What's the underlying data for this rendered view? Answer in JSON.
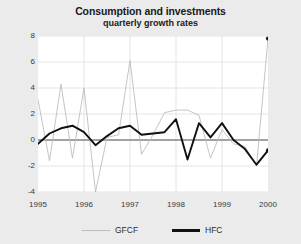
{
  "header": {
    "title": "Consumption and investments",
    "subtitle": "quarterly growth rates"
  },
  "annotations": {
    "unit": "(%)"
  },
  "legend": {
    "items": [
      {
        "label": "GFCF",
        "color": "#bdbdbd",
        "style": "thin-line"
      },
      {
        "label": "HFC",
        "color": "#111111",
        "style": "thick-line"
      }
    ]
  },
  "colors": {
    "background": "#ebebeb",
    "plot_background": "#ffffff",
    "gfcf": "#bdbdbd",
    "hfc": "#111111",
    "zero_line": "#555555",
    "gridline": "#e4e4e4",
    "text": "#2b2b2b"
  },
  "chart_data": {
    "type": "line",
    "title": "Consumption and investments",
    "subtitle": "quarterly growth rates",
    "xlabel": "",
    "ylabel": "(%)",
    "ylim": [
      -4,
      8
    ],
    "yticks": [
      -4,
      -2,
      0,
      2,
      4,
      6,
      8
    ],
    "ytick_labels": [
      "-4",
      "-2",
      "0",
      "2",
      "4",
      "6",
      "8"
    ],
    "xlim": [
      1995.0,
      2000.0
    ],
    "xticks": [
      1995,
      1996,
      1997,
      1998,
      1999,
      2000
    ],
    "xtick_labels": [
      "1995",
      "1996",
      "1997",
      "1998",
      "1999",
      "2000"
    ],
    "grid": true,
    "zero_line": true,
    "legend_position": "below",
    "x": [
      1995.0,
      1995.25,
      1995.5,
      1995.75,
      1996.0,
      1996.25,
      1996.5,
      1996.75,
      1997.0,
      1997.25,
      1997.5,
      1997.75,
      1998.0,
      1998.25,
      1998.5,
      1998.75,
      1999.0,
      1999.25,
      1999.5,
      1999.75,
      2000.0
    ],
    "series": [
      {
        "name": "GFCF",
        "color": "#bdbdbd",
        "end_marker": true,
        "values": [
          3.1,
          -1.6,
          4.3,
          -1.4,
          4.0,
          -4.0,
          0.2,
          0.4,
          6.1,
          -1.1,
          0.4,
          2.1,
          2.3,
          2.3,
          1.9,
          -1.4,
          0.8,
          -0.3,
          -0.5,
          -2.0,
          7.8
        ]
      },
      {
        "name": "HFC",
        "color": "#111111",
        "end_marker": true,
        "values": [
          -0.3,
          0.5,
          0.9,
          1.1,
          0.6,
          -0.4,
          0.3,
          0.9,
          1.1,
          0.4,
          0.5,
          0.6,
          1.6,
          -1.5,
          1.3,
          0.2,
          1.3,
          0.0,
          -0.7,
          -1.9,
          -0.8
        ]
      }
    ]
  }
}
